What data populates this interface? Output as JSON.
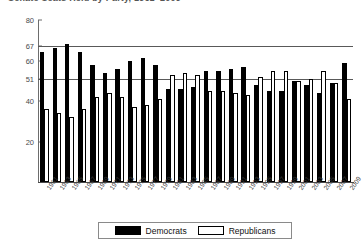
{
  "chart_data": {
    "type": "bar",
    "title": "Senate Seats Held by Party, 1961–2009",
    "xlabel": "",
    "ylabel": "",
    "ylim": [
      0,
      80
    ],
    "yticks": [
      20,
      40,
      51,
      60,
      67,
      80
    ],
    "ytick_labels": [
      "20",
      "40",
      "51",
      "60",
      "67",
      "80"
    ],
    "reference_lines": [
      {
        "value": 67,
        "label": "67"
      },
      {
        "value": 51,
        "label": "51"
      }
    ],
    "grid": false,
    "legend_position": "bottom",
    "categories": [
      "1961",
      "1963",
      "1965",
      "1967",
      "1969",
      "1971",
      "1973",
      "1975",
      "1977",
      "1979",
      "1981",
      "1983",
      "1985",
      "1987",
      "1989",
      "1991",
      "1993",
      "1995",
      "1997",
      "1999",
      "2001",
      "2003",
      "2005",
      "2007",
      "2009"
    ],
    "series": [
      {
        "name": "Democrats",
        "color": "#000000",
        "values": [
          64,
          66,
          68,
          64,
          58,
          54,
          56,
          60,
          61,
          58,
          46,
          46,
          47,
          55,
          55,
          56,
          57,
          48,
          45,
          45,
          50,
          48,
          44,
          49,
          59
        ]
      },
      {
        "name": "Republicans",
        "color": "#ffffff",
        "values": [
          36,
          34,
          32,
          36,
          42,
          44,
          42,
          37,
          38,
          41,
          53,
          54,
          53,
          45,
          45,
          44,
          43,
          52,
          55,
          55,
          50,
          51,
          55,
          49,
          41
        ]
      }
    ]
  },
  "legend": {
    "items": [
      {
        "label": "Democrats",
        "style": "filled-black"
      },
      {
        "label": "Republicans",
        "style": "outlined-white"
      }
    ]
  },
  "colors": {
    "democrat": "#000000",
    "republican": "#ffffff",
    "axis": "#4a4a4a",
    "reference_line": "#595959"
  }
}
